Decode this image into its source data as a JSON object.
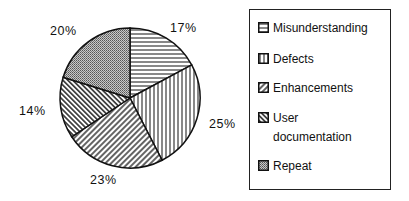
{
  "chart_data": {
    "type": "pie",
    "title": "",
    "categories": [
      "Misunderstanding",
      "Defects",
      "Enhancements",
      "User documentation",
      "Repeat"
    ],
    "values": [
      17,
      25,
      23,
      14,
      20
    ],
    "labels": [
      "17%",
      "25%",
      "23%",
      "14%",
      "20%"
    ],
    "patterns": [
      "horizontal-lines",
      "vertical-lines",
      "diagonal-backslash",
      "diagonal-slash",
      "dotted-gray"
    ],
    "start_angle_deg": 0,
    "direction": "clockwise",
    "legend_position": "right"
  },
  "legend": {
    "items": [
      {
        "label_lines": [
          "Misunderstanding"
        ]
      },
      {
        "label_lines": [
          "Defects"
        ]
      },
      {
        "label_lines": [
          "Enhancements"
        ]
      },
      {
        "label_lines": [
          "User",
          "documentation"
        ]
      },
      {
        "label_lines": [
          "Repeat"
        ]
      }
    ]
  }
}
